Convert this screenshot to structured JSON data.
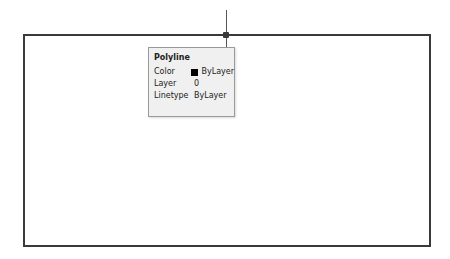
{
  "tooltip": {
    "title": "Polyline",
    "properties": [
      {
        "label": "Color",
        "value": "ByLayer",
        "swatch_color": "#000000"
      },
      {
        "label": "Layer",
        "value": "0"
      },
      {
        "label": "Linetype",
        "value": "ByLayer"
      }
    ]
  },
  "colors": {
    "background": "#ffffff",
    "polyline": "#3a3a3a",
    "tooltip_bg": "#f0f0f0"
  }
}
